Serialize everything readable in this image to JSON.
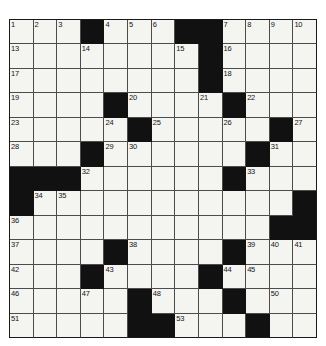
{
  "puzzle": {
    "type": "crossword-grid",
    "rows": 13,
    "cols": 13,
    "colors": {
      "block": "#111111",
      "cell": "#f4f4f1",
      "grid_line": "#4c4c4c",
      "border": "#1a1a1a",
      "number_text": "#141414",
      "page_background": "#ffffff"
    },
    "blocks": [
      [
        0,
        3
      ],
      [
        0,
        7
      ],
      [
        0,
        8
      ],
      [
        1,
        8
      ],
      [
        2,
        8
      ],
      [
        3,
        4
      ],
      [
        3,
        9
      ],
      [
        4,
        5
      ],
      [
        4,
        11
      ],
      [
        5,
        3
      ],
      [
        5,
        10
      ],
      [
        6,
        0
      ],
      [
        6,
        1
      ],
      [
        6,
        2
      ],
      [
        6,
        9
      ],
      [
        7,
        0
      ],
      [
        7,
        12
      ],
      [
        8,
        11
      ],
      [
        8,
        12
      ],
      [
        9,
        4
      ],
      [
        9,
        9
      ],
      [
        10,
        3
      ],
      [
        10,
        8
      ],
      [
        11,
        5
      ],
      [
        11,
        9
      ],
      [
        12,
        5
      ],
      [
        12,
        6
      ],
      [
        12,
        10
      ]
    ],
    "numbers": [
      {
        "row": 0,
        "col": 0,
        "label": "1"
      },
      {
        "row": 0,
        "col": 1,
        "label": "2"
      },
      {
        "row": 0,
        "col": 2,
        "label": "3"
      },
      {
        "row": 0,
        "col": 4,
        "label": "4"
      },
      {
        "row": 0,
        "col": 5,
        "label": "5"
      },
      {
        "row": 0,
        "col": 6,
        "label": "6"
      },
      {
        "row": 0,
        "col": 9,
        "label": "7"
      },
      {
        "row": 0,
        "col": 10,
        "label": "8"
      },
      {
        "row": 0,
        "col": 11,
        "label": "9"
      },
      {
        "row": 0,
        "col": 12,
        "label": "10"
      },
      {
        "row": 1,
        "col": 0,
        "label": "13"
      },
      {
        "row": 1,
        "col": 3,
        "label": "14"
      },
      {
        "row": 1,
        "col": 7,
        "label": "15"
      },
      {
        "row": 1,
        "col": 9,
        "label": "16"
      },
      {
        "row": 2,
        "col": 0,
        "label": "17"
      },
      {
        "row": 2,
        "col": 9,
        "label": "18"
      },
      {
        "row": 3,
        "col": 0,
        "label": "19"
      },
      {
        "row": 3,
        "col": 5,
        "label": "20"
      },
      {
        "row": 3,
        "col": 8,
        "label": "21"
      },
      {
        "row": 3,
        "col": 10,
        "label": "22"
      },
      {
        "row": 4,
        "col": 0,
        "label": "23"
      },
      {
        "row": 4,
        "col": 4,
        "label": "24"
      },
      {
        "row": 4,
        "col": 6,
        "label": "25"
      },
      {
        "row": 4,
        "col": 9,
        "label": "26"
      },
      {
        "row": 4,
        "col": 12,
        "label": "27"
      },
      {
        "row": 5,
        "col": 0,
        "label": "28"
      },
      {
        "row": 5,
        "col": 4,
        "label": "29"
      },
      {
        "row": 5,
        "col": 5,
        "label": "30"
      },
      {
        "row": 5,
        "col": 11,
        "label": "31"
      },
      {
        "row": 6,
        "col": 3,
        "label": "32"
      },
      {
        "row": 6,
        "col": 10,
        "label": "33"
      },
      {
        "row": 7,
        "col": 1,
        "label": "34"
      },
      {
        "row": 7,
        "col": 2,
        "label": "35"
      },
      {
        "row": 8,
        "col": 0,
        "label": "36"
      },
      {
        "row": 9,
        "col": 0,
        "label": "37"
      },
      {
        "row": 9,
        "col": 5,
        "label": "38"
      },
      {
        "row": 9,
        "col": 10,
        "label": "39"
      },
      {
        "row": 9,
        "col": 11,
        "label": "40"
      },
      {
        "row": 9,
        "col": 12,
        "label": "41"
      },
      {
        "row": 10,
        "col": 0,
        "label": "42"
      },
      {
        "row": 10,
        "col": 4,
        "label": "43"
      },
      {
        "row": 10,
        "col": 9,
        "label": "44"
      },
      {
        "row": 10,
        "col": 10,
        "label": "45"
      },
      {
        "row": 11,
        "col": 0,
        "label": "46"
      },
      {
        "row": 11,
        "col": 3,
        "label": "47"
      },
      {
        "row": 11,
        "col": 6,
        "label": "48"
      },
      {
        "row": 11,
        "col": 9,
        "label": "49"
      },
      {
        "row": 11,
        "col": 11,
        "label": "50"
      },
      {
        "row": 12,
        "col": 0,
        "label": "51"
      },
      {
        "row": 12,
        "col": 5,
        "label": "52"
      },
      {
        "row": 12,
        "col": 7,
        "label": "53"
      },
      {
        "row": 12,
        "col": 10,
        "label": "54"
      }
    ],
    "extra_numbers_note": ""
  },
  "grid_rows_spec": [
    {
      "row": 0,
      "cells": [
        {
          "label": "1"
        },
        {
          "label": "2"
        },
        {
          "label": "3"
        },
        {
          "black": true
        },
        {
          "label": "4"
        },
        {
          "label": "5"
        },
        {
          "label": "6"
        },
        {
          "black": true
        },
        {
          "black": true
        },
        {
          "label": "7"
        },
        {
          "label": "8"
        },
        {
          "label": "9"
        },
        {
          "label": "10"
        }
      ]
    }
  ]
}
